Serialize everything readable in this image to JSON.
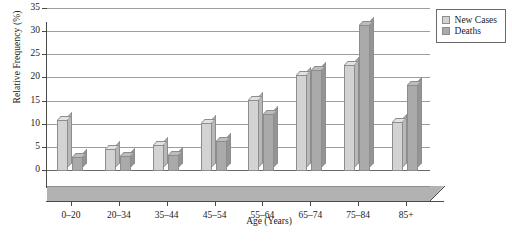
{
  "chart_data": {
    "type": "bar",
    "title": "",
    "xlabel": "Age (Years)",
    "ylabel": "Relative Frequency (%)",
    "categories": [
      "0–20",
      "20–34",
      "35–44",
      "45–54",
      "55–64",
      "65–74",
      "75–84",
      "85+"
    ],
    "series": [
      {
        "name": "New Cases",
        "color": "#d3d3d3",
        "values": [
          11.0,
          4.7,
          5.6,
          10.3,
          15.4,
          20.7,
          22.9,
          10.5
        ]
      },
      {
        "name": "Deaths",
        "color": "#aaaaaa",
        "values": [
          3.0,
          3.3,
          3.4,
          6.4,
          12.4,
          21.8,
          31.6,
          18.5
        ]
      }
    ],
    "ylim": [
      0,
      35
    ],
    "yticks": [
      0,
      5,
      10,
      15,
      20,
      25,
      30,
      35
    ],
    "ytick_labels": [
      "0",
      "5",
      "10",
      "15",
      "20",
      "25",
      "30",
      "35"
    ],
    "grid": true,
    "legend_position": "top-right"
  },
  "legend": {
    "entries": [
      {
        "label": "New Cases",
        "swatch": "cases"
      },
      {
        "label": "Deaths",
        "swatch": "deaths"
      }
    ]
  }
}
